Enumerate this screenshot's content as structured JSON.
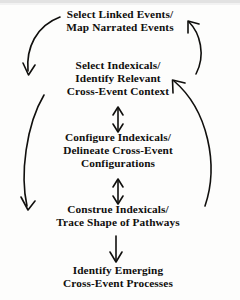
{
  "diagram": {
    "background_color": "#fdfdfc",
    "ink_color": "#100f0d",
    "nodes": [
      {
        "id": "select-linked-events",
        "lines": [
          "Select Linked Events/",
          "Map Narrated Events"
        ]
      },
      {
        "id": "select-indexicals",
        "lines": [
          "Select Indexicals/",
          "Identify Relevant",
          "Cross-Event Context"
        ]
      },
      {
        "id": "configure-indexicals",
        "lines": [
          "Configure Indexicals/",
          "Delineate Cross-Event",
          "Configurations"
        ]
      },
      {
        "id": "construe-indexicals",
        "lines": [
          "Construe Indexicals/",
          "Trace Shape of Pathways"
        ]
      },
      {
        "id": "identify-emerging",
        "lines": [
          "Identify Emerging",
          "Cross-Event Processes"
        ]
      }
    ],
    "connectors": [
      {
        "id": "arc-left-upper",
        "shape": "curve",
        "direction": "down",
        "from": "select-linked-events",
        "to": "select-indexicals",
        "side": "left"
      },
      {
        "id": "arc-left-lower",
        "shape": "curve",
        "direction": "down",
        "from": "select-indexicals",
        "to": "construe-indexicals",
        "side": "left"
      },
      {
        "id": "arc-right-upper",
        "shape": "curve",
        "direction": "up",
        "from": "select-indexicals",
        "to": "select-linked-events",
        "side": "right"
      },
      {
        "id": "arc-right-lower",
        "shape": "curve",
        "direction": "up",
        "from": "construe-indexicals",
        "to": "select-indexicals",
        "side": "right"
      },
      {
        "id": "arrow-center-upper",
        "shape": "straight",
        "direction": "bidirectional",
        "from": "select-indexicals",
        "to": "configure-indexicals",
        "side": "center"
      },
      {
        "id": "arrow-center-lower",
        "shape": "straight",
        "direction": "bidirectional",
        "from": "configure-indexicals",
        "to": "construe-indexicals",
        "side": "center"
      },
      {
        "id": "arrow-bottom",
        "shape": "straight",
        "direction": "down",
        "from": "construe-indexicals",
        "to": "identify-emerging",
        "side": "center"
      }
    ]
  }
}
